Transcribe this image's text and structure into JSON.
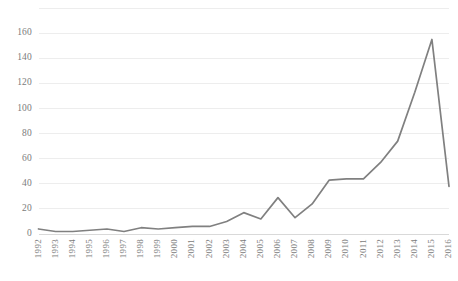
{
  "chart_data": {
    "type": "line",
    "title": "",
    "subtitle": "",
    "xlabel": "",
    "ylabel": "",
    "grid": true,
    "legend_position": "none",
    "legend_entries": [],
    "annotations": [],
    "line_color": "#808080",
    "gridline_color": "#ededed",
    "axis_color": "#d9d9d9",
    "tick_label_color": "#7b7b7b",
    "background_color": "#ffffff",
    "ylim": [
      0,
      180
    ],
    "yticks": [
      0,
      20,
      40,
      60,
      80,
      100,
      120,
      140,
      160
    ],
    "ytick_labels": [
      "0",
      "20",
      "40",
      "60",
      "80",
      "100",
      "120",
      "140",
      "160"
    ],
    "categories": [
      "1992",
      "1993",
      "1994",
      "1995",
      "1996",
      "1997",
      "1998",
      "1999",
      "2000",
      "2001",
      "2002",
      "2003",
      "2004",
      "2005",
      "2006",
      "2007",
      "2008",
      "2009",
      "2010",
      "2011",
      "2012",
      "2013",
      "2014",
      "2015",
      "2016"
    ],
    "values": [
      4,
      2,
      2,
      3,
      4,
      2,
      5,
      4,
      5,
      6,
      6,
      10,
      17,
      12,
      29,
      13,
      24,
      43,
      44,
      44,
      57,
      74,
      113,
      155,
      38
    ]
  }
}
